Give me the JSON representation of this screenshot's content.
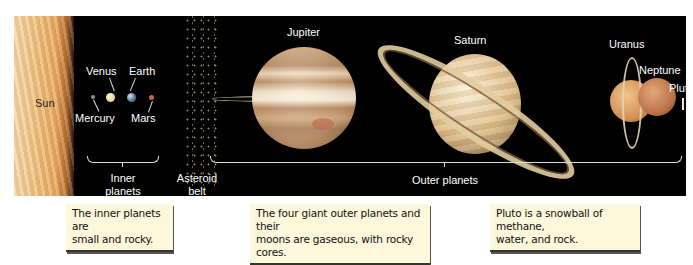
{
  "diagram": {
    "bodies": [
      {
        "name": "Sun",
        "label": "Sun",
        "color": "#f0c27e"
      },
      {
        "name": "Mercury",
        "label": "Mercury",
        "color": "#9a8f86"
      },
      {
        "name": "Venus",
        "label": "Venus",
        "color": "#e8d7a8"
      },
      {
        "name": "Earth",
        "label": "Earth",
        "color": "#6f8fb0"
      },
      {
        "name": "Mars",
        "label": "Mars",
        "color": "#c1693c"
      },
      {
        "name": "Jupiter",
        "label": "Jupiter",
        "color": "#d8b48a"
      },
      {
        "name": "Saturn",
        "label": "Saturn",
        "color": "#e5c896"
      },
      {
        "name": "Uranus",
        "label": "Uranus",
        "color": "#d9a06a"
      },
      {
        "name": "Neptune",
        "label": "Neptune",
        "color": "#c9895c"
      },
      {
        "name": "Pluto",
        "label": "Pluto",
        "color": "#ffffff"
      }
    ],
    "groups": {
      "inner": {
        "label_line1": "Inner",
        "label_line2": "planets"
      },
      "belt": {
        "label_line1": "Asteroid",
        "label_line2": "belt"
      },
      "outer": {
        "label": "Outer planets"
      }
    },
    "captions": [
      {
        "line1": "The inner planets are",
        "line2": "small and rocky."
      },
      {
        "line1": "The four giant outer planets and their",
        "line2": "moons are gaseous, with rocky cores."
      },
      {
        "line1": "Pluto is a snowball of methane,",
        "line2": "water, and rock."
      }
    ]
  }
}
